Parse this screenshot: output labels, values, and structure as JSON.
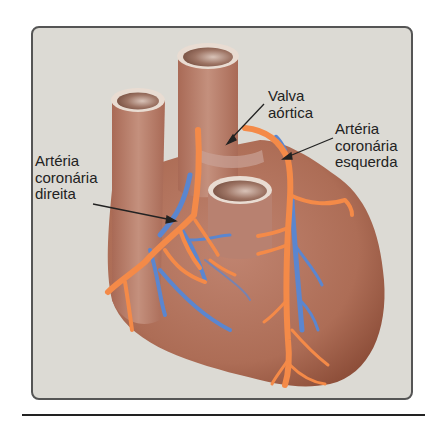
{
  "diagram": {
    "colors": {
      "panel_background": "#dcdad4",
      "heart_tissue": "#b06e55",
      "artery": "#f48a48",
      "vein": "#5b86cf",
      "vessel_rim": "#e9dcd2"
    },
    "labels": {
      "aortic_valve": {
        "line1": "Valva",
        "line2": "aórtica"
      },
      "left_coronary": {
        "line1": "Artéria",
        "line2": "coronária",
        "line3": "esquerda"
      },
      "right_coronary": {
        "line1": "Artéria",
        "line2": "coronária",
        "line3": "direita"
      }
    }
  }
}
